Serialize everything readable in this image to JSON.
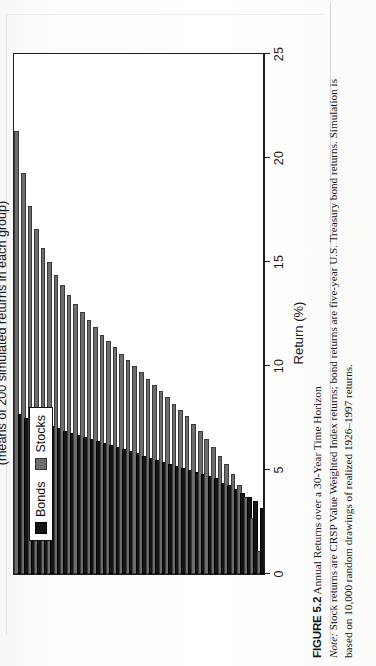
{
  "figure": {
    "number": "FIGURE 5.2",
    "title": "Annual Returns over a 30-Year Time Horizon",
    "note_label": "Note:",
    "note_line1": "Stock returns are CRSP Value Weighted Index returns; bond returns are five-year U.S. Treasury bond returns. Simulation is",
    "note_line2": "based on 10,000 random drawings of realized 1926–1997 returns."
  },
  "legend": {
    "position": "top-left",
    "items": [
      {
        "label": "Bonds",
        "color": "#141414"
      },
      {
        "label": "Stocks",
        "color": "#6d6d6d"
      }
    ]
  },
  "axes": {
    "value_axis_label": "Return (%)",
    "value_ticks": [
      "0",
      "5",
      "10",
      "15",
      "20",
      "25"
    ],
    "category_axis_line1": "Lowest to Highest Returns",
    "category_axis_line2": "(means of 200 simulated returns in each group)"
  },
  "chart_data": {
    "type": "bar",
    "orientation": "horizontal",
    "title": "Annual Returns over a 30-Year Time Horizon",
    "xlabel": "Return (%)",
    "ylabel": "Lowest to Highest Returns (means of 200 simulated returns in each group)",
    "xlim": [
      0,
      25
    ],
    "ylim": [
      0,
      38
    ],
    "grid": false,
    "legend_position": "top-left",
    "categories": [
      "1",
      "2",
      "3",
      "4",
      "5",
      "6",
      "7",
      "8",
      "9",
      "10",
      "11",
      "12",
      "13",
      "14",
      "15",
      "16",
      "17",
      "18",
      "19",
      "20",
      "21",
      "22",
      "23",
      "24",
      "25",
      "26",
      "27",
      "28",
      "29",
      "30",
      "31",
      "32",
      "33",
      "34",
      "35",
      "36",
      "37",
      "38"
    ],
    "series": [
      {
        "name": "Stocks",
        "color": "#6d6d6d",
        "values": [
          1.0,
          2.6,
          3.6,
          4.2,
          4.7,
          5.2,
          5.6,
          6.0,
          6.4,
          6.8,
          7.1,
          7.5,
          7.8,
          8.1,
          8.4,
          8.7,
          9.0,
          9.3,
          9.6,
          9.9,
          10.2,
          10.5,
          10.8,
          11.1,
          11.4,
          11.8,
          12.1,
          12.5,
          12.9,
          13.3,
          13.8,
          14.3,
          14.9,
          15.6,
          16.5,
          17.6,
          19.2,
          21.2
        ]
      },
      {
        "name": "Bonds",
        "color": "#141414",
        "values": [
          3.1,
          3.4,
          3.6,
          3.8,
          4.0,
          4.2,
          4.3,
          4.5,
          4.6,
          4.7,
          4.8,
          4.9,
          5.0,
          5.1,
          5.2,
          5.3,
          5.4,
          5.5,
          5.6,
          5.7,
          5.8,
          5.9,
          6.0,
          6.1,
          6.2,
          6.3,
          6.4,
          6.5,
          6.6,
          6.7,
          6.8,
          6.9,
          7.0,
          7.1,
          7.2,
          7.3,
          7.4,
          7.6
        ]
      }
    ]
  }
}
